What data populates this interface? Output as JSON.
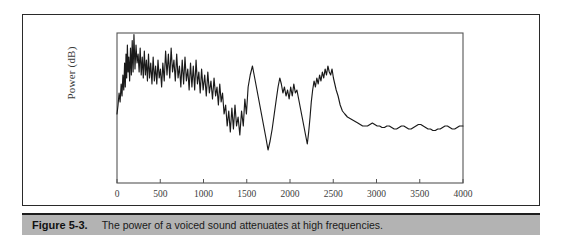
{
  "figure": {
    "caption_label": "Figure 5-3.",
    "caption_text": "The power of a voiced sound attenuates at high frequencies.",
    "caption_bar_color": "#b3b3b3",
    "border_color": "#2a2a2a",
    "background_color": "#ffffff"
  },
  "chart_data": {
    "type": "line",
    "title": "",
    "subtitle": "",
    "xlabel": "",
    "ylabel": "Power (dB)",
    "xlim": [
      0,
      4000
    ],
    "ylim": [
      0,
      100
    ],
    "grid": false,
    "legend": "none",
    "line_color": "#1a1a1a",
    "xticks": [
      0,
      500,
      1000,
      1500,
      2000,
      2500,
      3000,
      3500,
      4000
    ],
    "xtick_labels": [
      "0",
      "500",
      "1000",
      "1500",
      "2000",
      "2500",
      "3000",
      "3500",
      "4000"
    ],
    "yticks": [],
    "ytick_labels": [],
    "series": [
      {
        "name": "voiced sound power spectrum",
        "x": [
          0,
          12,
          24,
          36,
          48,
          58,
          68,
          78,
          88,
          96,
          104,
          112,
          120,
          128,
          136,
          146,
          156,
          166,
          176,
          186,
          196,
          208,
          220,
          232,
          244,
          256,
          268,
          280,
          292,
          304,
          316,
          328,
          340,
          352,
          364,
          376,
          390,
          404,
          418,
          432,
          446,
          460,
          474,
          488,
          502,
          516,
          530,
          546,
          562,
          578,
          594,
          610,
          626,
          642,
          658,
          674,
          690,
          706,
          722,
          738,
          754,
          770,
          786,
          802,
          818,
          834,
          850,
          866,
          882,
          898,
          914,
          930,
          946,
          962,
          978,
          996,
          1014,
          1032,
          1050,
          1068,
          1086,
          1104,
          1122,
          1140,
          1156,
          1172,
          1188,
          1204,
          1220,
          1238,
          1256,
          1274,
          1292,
          1310,
          1328,
          1346,
          1364,
          1382,
          1400,
          1420,
          1440,
          1460,
          1478,
          1496,
          1516,
          1540,
          1566,
          1592,
          1618,
          1644,
          1670,
          1696,
          1722,
          1746,
          1770,
          1794,
          1818,
          1842,
          1862,
          1882,
          1900,
          1918,
          1936,
          1954,
          1972,
          1990,
          2008,
          2026,
          2044,
          2062,
          2080,
          2100,
          2120,
          2140,
          2160,
          2180,
          2200,
          2216,
          2232,
          2246,
          2262,
          2278,
          2294,
          2310,
          2326,
          2342,
          2358,
          2374,
          2390,
          2406,
          2422,
          2438,
          2454,
          2470,
          2486,
          2502,
          2518,
          2534,
          2556,
          2580,
          2606,
          2634,
          2664,
          2694,
          2724,
          2754,
          2784,
          2812,
          2840,
          2868,
          2896,
          2924,
          2952,
          2980,
          3008,
          3036,
          3064,
          3092,
          3120,
          3148,
          3176,
          3204,
          3232,
          3260,
          3288,
          3316,
          3344,
          3372,
          3400,
          3428,
          3456,
          3484,
          3512,
          3540,
          3568,
          3596,
          3624,
          3652,
          3680,
          3708,
          3736,
          3764,
          3792,
          3820,
          3848,
          3876,
          3904,
          3932,
          3960,
          3980,
          4000
        ],
        "y": [
          46,
          52,
          60,
          54,
          66,
          58,
          72,
          62,
          80,
          64,
          86,
          70,
          92,
          74,
          84,
          68,
          90,
          72,
          95,
          74,
          99,
          76,
          92,
          80,
          86,
          74,
          90,
          72,
          84,
          70,
          88,
          72,
          82,
          68,
          86,
          70,
          80,
          66,
          84,
          68,
          78,
          66,
          82,
          70,
          76,
          64,
          80,
          68,
          88,
          72,
          86,
          70,
          90,
          74,
          82,
          68,
          86,
          70,
          78,
          64,
          82,
          66,
          84,
          68,
          76,
          62,
          80,
          64,
          78,
          62,
          82,
          66,
          74,
          60,
          76,
          62,
          72,
          58,
          74,
          60,
          68,
          56,
          70,
          58,
          64,
          52,
          66,
          54,
          60,
          46,
          52,
          38,
          48,
          34,
          50,
          36,
          52,
          38,
          44,
          32,
          48,
          38,
          56,
          46,
          64,
          72,
          78,
          70,
          62,
          54,
          46,
          38,
          30,
          22,
          28,
          36,
          46,
          56,
          64,
          70,
          66,
          60,
          64,
          58,
          62,
          56,
          64,
          58,
          66,
          60,
          62,
          56,
          50,
          44,
          38,
          32,
          26,
          34,
          44,
          54,
          62,
          68,
          64,
          70,
          66,
          72,
          68,
          74,
          70,
          76,
          72,
          78,
          74,
          72,
          76,
          70,
          66,
          62,
          58,
          52,
          48,
          46,
          44,
          43,
          42,
          41,
          40,
          39,
          38,
          38,
          38,
          39,
          40,
          39,
          38,
          38,
          37,
          37,
          38,
          38,
          37,
          36,
          36,
          37,
          38,
          38,
          37,
          36,
          36,
          37,
          38,
          39,
          39,
          38,
          37,
          36,
          36,
          35,
          35,
          36,
          36,
          37,
          38,
          38,
          37,
          36,
          36,
          37,
          38,
          38,
          38
        ]
      }
    ]
  }
}
